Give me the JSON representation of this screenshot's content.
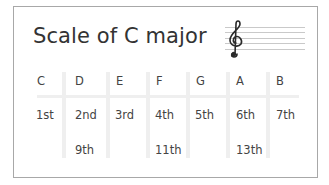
{
  "title": "Scale of C major",
  "staff": {
    "clef": "treble-clef",
    "clef_glyph": "𝄞",
    "line_count": 5
  },
  "colors": {
    "border": "#a8a8a8",
    "separator": "#efefef",
    "text": "#333333"
  },
  "scale": {
    "columns": [
      {
        "note": "C",
        "degree": "1st",
        "extension": ""
      },
      {
        "note": "D",
        "degree": "2nd",
        "extension": "9th"
      },
      {
        "note": "E",
        "degree": "3rd",
        "extension": ""
      },
      {
        "note": "F",
        "degree": "4th",
        "extension": "11th"
      },
      {
        "note": "G",
        "degree": "5th",
        "extension": ""
      },
      {
        "note": "A",
        "degree": "6th",
        "extension": "13th"
      },
      {
        "note": "B",
        "degree": "7th",
        "extension": ""
      }
    ]
  }
}
